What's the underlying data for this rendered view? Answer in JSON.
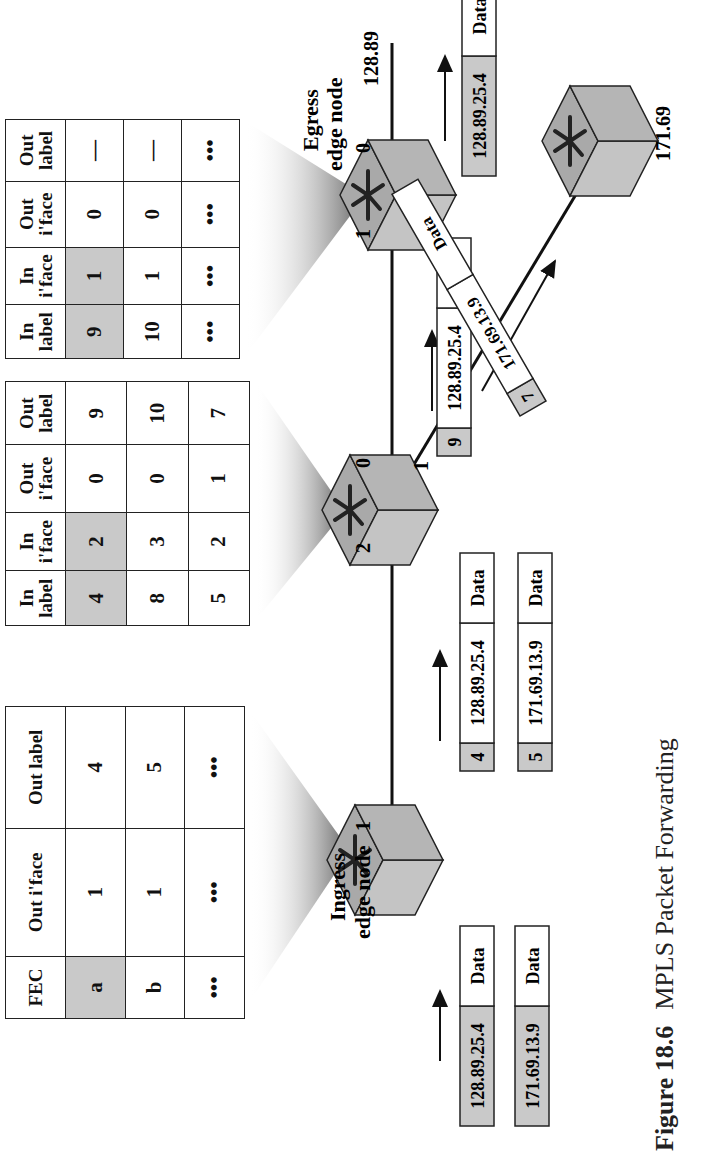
{
  "caption": {
    "figure": "Figure 18.6",
    "title": "MPLS Packet Forwarding"
  },
  "tables": {
    "ingress": {
      "headers": [
        "FEC",
        "Out i'face",
        "Out label"
      ],
      "rows": [
        [
          "a",
          "1",
          "4"
        ],
        [
          "b",
          "1",
          "5"
        ],
        [
          "•••",
          "•••",
          "•••"
        ]
      ],
      "highlight_first_row_cols": 1
    },
    "middle": {
      "headers": [
        "In label",
        "In i'face",
        "Out i'face",
        "Out label"
      ],
      "rows": [
        [
          "4",
          "2",
          "0",
          "9"
        ],
        [
          "8",
          "3",
          "0",
          "10"
        ],
        [
          "5",
          "2",
          "1",
          "7"
        ]
      ],
      "highlight_first_row_cols": 2
    },
    "egress": {
      "headers": [
        "In label",
        "In i'face",
        "Out i'face",
        "Out label"
      ],
      "rows": [
        [
          "9",
          "1",
          "0",
          "—"
        ],
        [
          "10",
          "1",
          "0",
          "—"
        ],
        [
          "•••",
          "•••",
          "•••",
          "•••"
        ]
      ],
      "highlight_first_row_cols": 2
    }
  },
  "nodes": {
    "ingress": {
      "label_line1": "Ingress",
      "label_line2": "edge node",
      "port_out": "1"
    },
    "middle": {
      "port_in": "2",
      "port_out0": "0",
      "port_out1": "1"
    },
    "egress": {
      "label_line1": "Egress",
      "label_line2": "edge node",
      "port_in": "1",
      "port_out": "0",
      "network": "128.89"
    },
    "branch": {
      "network": "171.69"
    }
  },
  "packets": {
    "in1": {
      "addr": "128.89.25.4",
      "data": "Data"
    },
    "in2": {
      "addr": "171.69.13.9",
      "data": "Data"
    },
    "l1a": {
      "label": "4",
      "addr": "128.89.25.4",
      "data": "Data"
    },
    "l1b": {
      "label": "5",
      "addr": "171.69.13.9",
      "data": "Data"
    },
    "l2a": {
      "label": "9",
      "addr": "128.89.25.4",
      "data": "Data"
    },
    "l2b": {
      "label": "7",
      "addr": "171.69.13.9",
      "data": "Data"
    },
    "out": {
      "addr": "128.89.25.4",
      "data": "Data"
    }
  },
  "colors": {
    "highlight": "#c9c9c9",
    "router_front": "#c4c4c4",
    "router_top": "#a9a9a9",
    "router_side": "#bdbdbd",
    "line": "#111111"
  }
}
